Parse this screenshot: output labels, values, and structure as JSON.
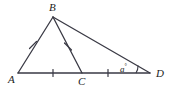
{
  "figure": {
    "type": "geometry-diagram",
    "background_color": "#ffffff",
    "stroke_color": "#3a3a45",
    "label_color": "#1c1c1c",
    "width": 172,
    "height": 92
  },
  "points": {
    "A": {
      "label": "A",
      "x": 18,
      "y": 73,
      "label_x": 8,
      "label_y": 75
    },
    "B": {
      "label": "B",
      "x": 53,
      "y": 17,
      "label_x": 49,
      "label_y": 2
    },
    "C": {
      "label": "C",
      "x": 82,
      "y": 73,
      "label_x": 78,
      "label_y": 76
    },
    "D": {
      "label": "D",
      "x": 150,
      "y": 73,
      "label_x": 155,
      "label_y": 68
    }
  },
  "segments": [
    {
      "name": "AB",
      "from": "A",
      "to": "B",
      "ticks": 1
    },
    {
      "name": "BC",
      "from": "B",
      "to": "C",
      "ticks": 1
    },
    {
      "name": "BD",
      "from": "B",
      "to": "D",
      "ticks": 0
    },
    {
      "name": "AC",
      "from": "A",
      "to": "C",
      "ticks": 1
    },
    {
      "name": "CD",
      "from": "C",
      "to": "D",
      "ticks": 1
    }
  ],
  "tick_marks": [
    {
      "name": "tick-ab",
      "x": 33,
      "y": 45,
      "angle": -58
    },
    {
      "name": "tick-bc",
      "x": 68,
      "y": 46,
      "angle": 63
    },
    {
      "name": "tick-ac",
      "x": 53,
      "y": 73,
      "angle": 0
    },
    {
      "name": "tick-cd",
      "x": 108,
      "y": 73,
      "angle": 0
    }
  ],
  "angles": [
    {
      "name": "angle-at-D",
      "vertex": "D",
      "label": "a",
      "degree_symbol": "°",
      "label_x": 120,
      "label_y": 62,
      "arc_radius": 14
    }
  ]
}
